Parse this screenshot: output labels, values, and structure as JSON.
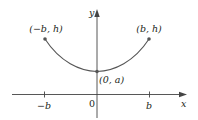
{
  "diagram": {
    "type": "catenary-curve-graph",
    "axes": {
      "x_label": "x",
      "y_label": "y",
      "origin_label": "0",
      "x_ticks": [
        {
          "label": "−b",
          "position": "-b"
        },
        {
          "label": "b",
          "position": "b"
        }
      ]
    },
    "points": [
      {
        "label": "(−b, h)",
        "coords": [
          "-b",
          "h"
        ]
      },
      {
        "label": "(b, h)",
        "coords": [
          "b",
          "h"
        ]
      },
      {
        "label": "(0, a)",
        "coords": [
          "0",
          "a"
        ]
      }
    ],
    "curve": {
      "description": "U-shaped curve symmetric about the y-axis from (−b, h) down to minimum (0, a) and up to (b, h)"
    },
    "colors": {
      "curve": "#555555",
      "axes": "#444444",
      "text": "#231f20",
      "background": "#ffffff"
    }
  }
}
